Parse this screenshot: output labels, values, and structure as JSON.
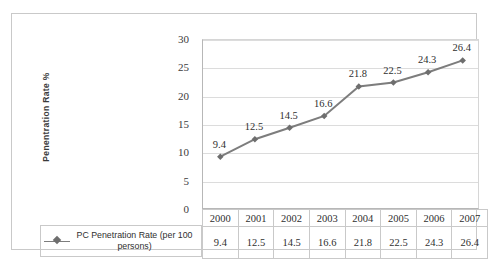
{
  "chart_data": {
    "type": "line",
    "title": "",
    "xlabel": "",
    "ylabel": "Penentration Rate %",
    "categories": [
      "2000",
      "2001",
      "2002",
      "2003",
      "2004",
      "2005",
      "2006",
      "2007"
    ],
    "series": [
      {
        "name": "PC Penetration Rate (per 100 persons)",
        "values": [
          9.4,
          12.5,
          14.5,
          16.6,
          21.8,
          22.5,
          24.3,
          26.4
        ]
      }
    ],
    "value_labels": [
      "9.4",
      "12.5",
      "14.5",
      "16.6",
      "21.8",
      "22.5",
      "24.3",
      "26.4"
    ],
    "ylim": [
      0,
      30
    ],
    "y_ticks": [
      "0",
      "5",
      "10",
      "15",
      "20",
      "25",
      "30"
    ],
    "grid": true,
    "legend_position": "bottom-left",
    "data_table_shown": true,
    "line_color": "#7d7d7d",
    "marker_color": "#6e6e6e",
    "marker_shape": "diamond",
    "gridline_color": "#dcdcdc",
    "axis_color": "#b7b7b7",
    "border_color": "#c9c9c9",
    "text_color": "#2f2f2f"
  },
  "axis": {
    "y_title": "Penentration Rate %",
    "y_ticks": [
      {
        "label": "30",
        "value": 30
      },
      {
        "label": "25",
        "value": 25
      },
      {
        "label": "20",
        "value": 20
      },
      {
        "label": "15",
        "value": 15
      },
      {
        "label": "10",
        "value": 10
      },
      {
        "label": "5",
        "value": 5
      },
      {
        "label": "0",
        "value": 0
      }
    ]
  },
  "legend": {
    "marker": "line-diamond-marker",
    "label": "PC Penetration Rate (per 100 persons)"
  },
  "table": {
    "header_row": [
      "2000",
      "2001",
      "2002",
      "2003",
      "2004",
      "2005",
      "2006",
      "2007"
    ],
    "value_row": [
      "9.4",
      "12.5",
      "14.5",
      "16.6",
      "21.8",
      "22.5",
      "24.3",
      "26.4"
    ]
  }
}
